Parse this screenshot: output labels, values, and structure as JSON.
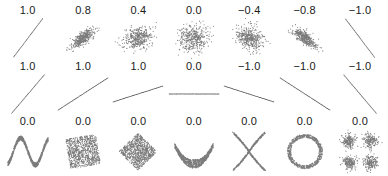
{
  "figure": {
    "width": 388,
    "height": 176,
    "background_color": "#ffffff",
    "point_color": "#2a2a2a",
    "label_color": "#1a1a1a",
    "rows": 3,
    "columns": 7
  },
  "chart_data": {
    "type": "scatter",
    "title": "",
    "subtitle": "",
    "xlabel": "",
    "ylabel": "",
    "grid": false,
    "axes_visible": false,
    "legend": "none",
    "xlim": [
      -1,
      1
    ],
    "ylim": [
      -1,
      1
    ],
    "panels": [
      {
        "row": 1,
        "col": 1,
        "label": "1.0",
        "value": 1.0,
        "shape": "line-positive-steep",
        "n_points": 260,
        "noise": 0.0,
        "slope": 1.6,
        "description": "Perfectly correlated points lying on an upward sloping line"
      },
      {
        "row": 1,
        "col": 2,
        "label": "0.8",
        "value": 0.8,
        "shape": "cloud-elliptical",
        "n_points": 420,
        "noise": 0.36,
        "slope": 1.0,
        "description": "Elongated cloud tilted upward, strong positive correlation"
      },
      {
        "row": 1,
        "col": 3,
        "label": "0.4",
        "value": 0.4,
        "shape": "cloud-elliptical",
        "n_points": 420,
        "noise": 0.78,
        "slope": 1.0,
        "description": "Round-ish cloud slightly tilted upward, weak positive correlation"
      },
      {
        "row": 1,
        "col": 4,
        "label": "0.0",
        "value": 0.0,
        "shape": "cloud-circular",
        "n_points": 420,
        "noise": 1.0,
        "slope": 0.0,
        "description": "Circular isotropic cloud, no correlation"
      },
      {
        "row": 1,
        "col": 5,
        "label": "−0.4",
        "value": -0.4,
        "shape": "cloud-elliptical",
        "n_points": 420,
        "noise": 0.78,
        "slope": -1.0,
        "description": "Round-ish cloud slightly tilted downward, weak negative correlation"
      },
      {
        "row": 1,
        "col": 6,
        "label": "−0.8",
        "value": -0.8,
        "shape": "cloud-elliptical",
        "n_points": 420,
        "noise": 0.36,
        "slope": -1.0,
        "description": "Elongated cloud tilted downward, strong negative correlation"
      },
      {
        "row": 1,
        "col": 7,
        "label": "−1.0",
        "value": -1.0,
        "shape": "line-negative-steep",
        "n_points": 260,
        "noise": 0.0,
        "slope": -1.6,
        "description": "Perfectly anti-correlated points lying on a downward sloping line"
      },
      {
        "row": 2,
        "col": 1,
        "label": "1.0",
        "value": 1.0,
        "shape": "line",
        "n_points": 200,
        "noise": 0.0,
        "slope": 1.55,
        "description": "Steep upward line, correlation 1 regardless of slope magnitude"
      },
      {
        "row": 2,
        "col": 2,
        "label": "1.0",
        "value": 1.0,
        "shape": "line",
        "n_points": 200,
        "noise": 0.0,
        "slope": 0.85,
        "description": "Moderate upward line, correlation still 1"
      },
      {
        "row": 2,
        "col": 3,
        "label": "1.0",
        "value": 1.0,
        "shape": "line",
        "n_points": 200,
        "noise": 0.0,
        "slope": 0.42,
        "description": "Shallow upward line, correlation still 1"
      },
      {
        "row": 2,
        "col": 4,
        "label": "0.0",
        "value": 0.0,
        "shape": "line-flat",
        "n_points": 200,
        "noise": 0.0,
        "slope": 0.0,
        "description": "Horizontal line: correlation undefined / shown as 0 because variance of y is zero"
      },
      {
        "row": 2,
        "col": 5,
        "label": "−1.0",
        "value": -1.0,
        "shape": "line",
        "n_points": 200,
        "noise": 0.0,
        "slope": -0.42,
        "description": "Shallow downward line, correlation -1"
      },
      {
        "row": 2,
        "col": 6,
        "label": "−1.0",
        "value": -1.0,
        "shape": "line",
        "n_points": 200,
        "noise": 0.0,
        "slope": -0.85,
        "description": "Moderate downward line, correlation -1"
      },
      {
        "row": 2,
        "col": 7,
        "label": "−1.0",
        "value": -1.0,
        "shape": "line",
        "n_points": 200,
        "noise": 0.0,
        "slope": -1.55,
        "description": "Steep downward line, correlation -1"
      },
      {
        "row": 3,
        "col": 1,
        "label": "0.0",
        "value": 0.0,
        "shape": "sine-w",
        "n_points": 900,
        "noise": 0.05,
        "description": "W shaped sinusoidal band, nonlinear relation with zero correlation"
      },
      {
        "row": 3,
        "col": 2,
        "label": "0.0",
        "value": 0.0,
        "shape": "square-rotated-10",
        "n_points": 900,
        "noise": 0.0,
        "description": "Filled square rotated about 10 degrees"
      },
      {
        "row": 3,
        "col": 3,
        "label": "0.0",
        "value": 0.0,
        "shape": "square-rotated-45",
        "n_points": 900,
        "noise": 0.0,
        "description": "Filled square rotated 45 degrees (diamond)"
      },
      {
        "row": 3,
        "col": 4,
        "label": "0.0",
        "value": 0.0,
        "shape": "crescent-u",
        "n_points": 900,
        "noise": 0.0,
        "description": "U shaped crescent band, symmetric parabola with zero correlation"
      },
      {
        "row": 3,
        "col": 5,
        "label": "0.0",
        "value": 0.0,
        "shape": "cross-x",
        "n_points": 800,
        "noise": 0.0,
        "description": "X shaped pair of crossing curved bands"
      },
      {
        "row": 3,
        "col": 6,
        "label": "0.0",
        "value": 0.0,
        "shape": "ring",
        "n_points": 800,
        "noise": 0.05,
        "description": "Circular ring / annulus of points"
      },
      {
        "row": 3,
        "col": 7,
        "label": "0.0",
        "value": 0.0,
        "shape": "four-clusters",
        "n_points": 800,
        "noise": 0.12,
        "description": "Four separate symmetric clusters in the quadrants"
      }
    ]
  }
}
